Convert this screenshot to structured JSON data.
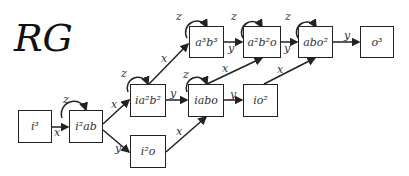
{
  "title": "RG",
  "nodes": [
    {
      "id": "i3",
      "base": "i",
      "sup": "3"
    },
    {
      "id": "i2ab",
      "label": "i²ab"
    },
    {
      "id": "ia2b2",
      "label": "ia²b²"
    },
    {
      "id": "i2o",
      "label": "i²o"
    },
    {
      "id": "a3b3",
      "label": "a³b³"
    },
    {
      "id": "iabo",
      "label": "iabo"
    },
    {
      "id": "a2b2o",
      "label": "a²b²o"
    },
    {
      "id": "io2",
      "label": "io²"
    },
    {
      "id": "abo2",
      "label": "abo²"
    },
    {
      "id": "o3",
      "label": "o³"
    }
  ],
  "labels": {
    "i3": "i³",
    "i2ab": "i²ab",
    "ia2b2": "ia²b²",
    "i2o": "i²o",
    "a3b3": "a³b³",
    "iabo": "iabo",
    "a2b2o": "a²b²o",
    "io2": "io²",
    "abo2": "abo²",
    "o3": "o³"
  },
  "edges": [
    {
      "from": "i3",
      "to": "i2ab",
      "label": "x"
    },
    {
      "from": "i2ab",
      "to": "i2ab",
      "label": "z"
    },
    {
      "from": "i2ab",
      "to": "ia2b2",
      "label": "x"
    },
    {
      "from": "i2ab",
      "to": "i2o",
      "label": "y"
    },
    {
      "from": "ia2b2",
      "to": "ia2b2",
      "label": "z"
    },
    {
      "from": "ia2b2",
      "to": "a3b3",
      "label": "x"
    },
    {
      "from": "ia2b2",
      "to": "iabo",
      "label": "y"
    },
    {
      "from": "i2o",
      "to": "iabo",
      "label": "x"
    },
    {
      "from": "a3b3",
      "to": "a3b3",
      "label": "z"
    },
    {
      "from": "a3b3",
      "to": "a2b2o",
      "label": "y"
    },
    {
      "from": "iabo",
      "to": "iabo",
      "label": "z"
    },
    {
      "from": "iabo",
      "to": "a2b2o",
      "label": "x"
    },
    {
      "from": "iabo",
      "to": "io2",
      "label": "y"
    },
    {
      "from": "a2b2o",
      "to": "a2b2o",
      "label": "z"
    },
    {
      "from": "a2b2o",
      "to": "abo2",
      "label": "y"
    },
    {
      "from": "io2",
      "to": "abo2",
      "label": "x"
    },
    {
      "from": "abo2",
      "to": "abo2",
      "label": "z"
    },
    {
      "from": "abo2",
      "to": "o3",
      "label": "y"
    }
  ],
  "edge_labels": {
    "x": "x",
    "y": "y",
    "z": "z"
  }
}
